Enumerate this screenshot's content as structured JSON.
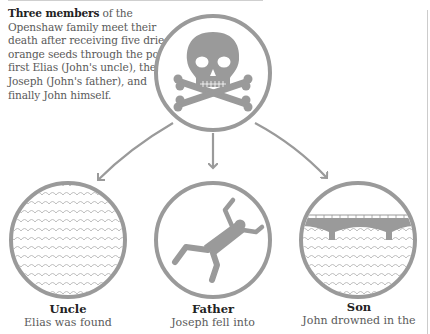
{
  "intro": {
    "bold_lead": "Three members",
    "text": " of the Openshaw family meet their death after receiving five dried orange seeds through the post: first Elias (John's uncle), then Joseph (John's father), and finally John himself."
  },
  "top_icon": "skull-and-crossbones-icon",
  "members": [
    {
      "title": "Uncle",
      "desc": "Elias was found",
      "icon": "water-waves-icon"
    },
    {
      "title": "Father",
      "desc": "Joseph fell into",
      "icon": "falling-man-icon"
    },
    {
      "title": "Son",
      "desc": "John drowned in the",
      "icon": "bridge-over-water-icon"
    }
  ],
  "colors": {
    "stroke": "#9a9a9a",
    "fill": "#9a9a9a",
    "wave": "#b0b0b0"
  }
}
